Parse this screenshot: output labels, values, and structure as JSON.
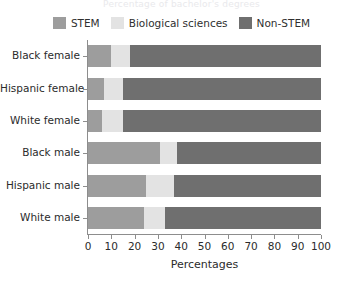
{
  "figure": {
    "title_sliver": "Percentage of bachelor's degrees",
    "x_axis_title": "Percentages"
  },
  "legend": {
    "position": "top-center",
    "entries": [
      {
        "label": "STEM",
        "color": "#9d9d9d",
        "swatch_name": "legend-swatch-stem"
      },
      {
        "label": "Biological sciences",
        "color": "#e3e3e3",
        "swatch_name": "legend-swatch-biological-sciences"
      },
      {
        "label": "Non-STEM",
        "color": "#6f6f6f",
        "swatch_name": "legend-swatch-non-stem"
      }
    ]
  },
  "chart_data": {
    "type": "bar",
    "orientation": "horizontal",
    "stacked": true,
    "title": "",
    "xlabel": "Percentages",
    "ylabel": "",
    "xlim": [
      0,
      100
    ],
    "xticks": [
      0,
      10,
      20,
      30,
      40,
      50,
      60,
      70,
      80,
      90,
      100
    ],
    "xtick_labels": [
      "0",
      "10",
      "20",
      "30",
      "40",
      "50",
      "60",
      "70",
      "80",
      "90",
      "100"
    ],
    "grid": false,
    "legend_position": "top-center",
    "categories": [
      "Black female",
      "Hispanic female",
      "White female",
      "Black male",
      "Hispanic male",
      "White male"
    ],
    "series": [
      {
        "name": "STEM",
        "color": "#9d9d9d",
        "values": [
          10,
          7,
          6,
          31,
          25,
          24
        ]
      },
      {
        "name": "Biological sciences",
        "color": "#e3e3e3",
        "values": [
          8,
          8,
          9,
          7,
          12,
          9
        ]
      },
      {
        "name": "Non-STEM",
        "color": "#6f6f6f",
        "values": [
          82,
          85,
          85,
          62,
          63,
          67
        ]
      }
    ]
  }
}
